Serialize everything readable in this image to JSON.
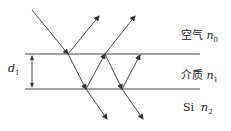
{
  "diagram": {
    "layers": [
      {
        "name": "空气",
        "index_symbol": "n",
        "index_sub": "0"
      },
      {
        "name": "介质",
        "index_symbol": "n",
        "index_sub": "1"
      },
      {
        "name": "Si",
        "index_symbol": "n",
        "index_sub": "2"
      }
    ],
    "thickness": {
      "symbol": "d",
      "sub": "1"
    },
    "line_color": "#333333"
  }
}
